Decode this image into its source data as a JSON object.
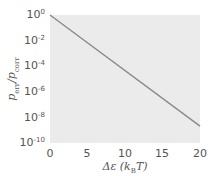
{
  "chart_data": {
    "type": "line",
    "title": "",
    "xlabel": "Δε (k_B T)",
    "ylabel": "p_err / p_corr",
    "xscale": "linear",
    "yscale": "log",
    "xlim": [
      0,
      20
    ],
    "ylim": [
      1e-10,
      1
    ],
    "grid": false,
    "legend": null,
    "x_ticks": [
      0,
      5,
      10,
      15,
      20
    ],
    "y_ticks": [
      "10^0",
      "10^-2",
      "10^-4",
      "10^-6",
      "10^-8",
      "10^-10"
    ],
    "series": [
      {
        "name": "exp(-Δε)",
        "color": "#8a8a8a",
        "x": [
          0,
          5,
          10,
          15,
          20
        ],
        "y": [
          1,
          0.0067,
          4.5e-05,
          3.1e-07,
          2.1e-09
        ]
      }
    ]
  },
  "labels": {
    "x_ticks": [
      "0",
      "5",
      "10",
      "15",
      "20"
    ],
    "y_ticks": [
      {
        "base": "10",
        "exp": "0"
      },
      {
        "base": "10",
        "exp": "-2"
      },
      {
        "base": "10",
        "exp": "-4"
      },
      {
        "base": "10",
        "exp": "-6"
      },
      {
        "base": "10",
        "exp": "-8"
      },
      {
        "base": "10",
        "exp": "-10"
      }
    ],
    "xlabel": {
      "main": "Δε (k",
      "sub": "B",
      "tail": "T)"
    },
    "ylabel": {
      "p1": "p",
      "s1": "err",
      "mid": "/",
      "p2": "p",
      "s2": "corr"
    }
  }
}
